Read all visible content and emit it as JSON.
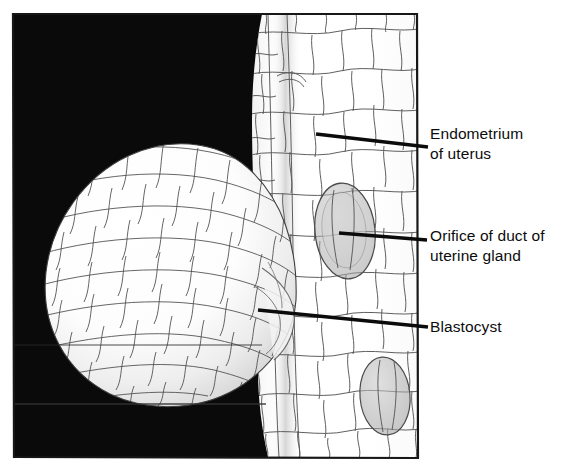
{
  "figure": {
    "kind": "anatomical-illustration",
    "background_color": "#0a0a0a",
    "panel": {
      "left": 13,
      "top": 13,
      "right": 418,
      "bottom": 458
    },
    "labels": [
      {
        "id": "endometrium",
        "name": "label-endometrium",
        "lines": [
          "Endometrium",
          "of uterus"
        ],
        "text_x": 430,
        "text_y": 139,
        "leader": {
          "x1": 316,
          "y1": 134,
          "x2": 428,
          "y2": 147
        }
      },
      {
        "id": "orifice",
        "name": "label-orifice-of-duct",
        "lines": [
          "Orifice of duct of",
          "uterine gland"
        ],
        "text_x": 430,
        "text_y": 241,
        "leader": {
          "x1": 339,
          "y1": 233,
          "x2": 427,
          "y2": 240
        }
      },
      {
        "id": "blastocyst",
        "name": "label-blastocyst",
        "lines": [
          "Blastocyst"
        ],
        "text_x": 430,
        "text_y": 332,
        "leader": {
          "x1": 258,
          "y1": 310,
          "x2": 428,
          "y2": 327
        }
      }
    ],
    "structures": [
      {
        "id": "blastocyst-sphere",
        "name": "blastocyst",
        "center_x": 168,
        "center_y": 275,
        "radius_x": 128,
        "radius_y": 122
      },
      {
        "id": "endometrium-wall",
        "name": "endometrium-of-uterus"
      },
      {
        "id": "gland-orifice-upper",
        "name": "orifice-of-duct-of-uterine-gland",
        "center_x": 345,
        "center_y": 231,
        "radius_x": 30,
        "radius_y": 48
      },
      {
        "id": "gland-orifice-lower",
        "name": "orifice-of-duct-of-uterine-gland",
        "center_x": 385,
        "center_y": 396,
        "radius_x": 24,
        "radius_y": 38
      }
    ],
    "colors": {
      "background": "#0a0a0a",
      "tissue": "#ffffff",
      "cell_outline": "#4a4a4a",
      "leader": "#0b0b0b",
      "text": "#0c0c0c",
      "frame": "#171717",
      "shading": "#b9b9b9"
    }
  }
}
